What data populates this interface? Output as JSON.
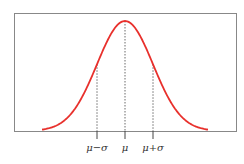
{
  "chart_data": {
    "type": "line",
    "title": "",
    "xlabel": "",
    "ylabel": "",
    "tick_labels": [
      "μ−σ",
      "μ",
      "μ+σ"
    ],
    "tick_positions_sigma": [
      -1,
      0,
      1
    ],
    "x_range_sigma": [
      -3,
      3
    ],
    "series": [
      {
        "name": "normal pdf",
        "color": "#e8302c"
      }
    ],
    "grid": false,
    "legend": "none"
  },
  "labels": {
    "minus": "μ−σ",
    "mu": "μ",
    "plus": "μ+σ"
  }
}
